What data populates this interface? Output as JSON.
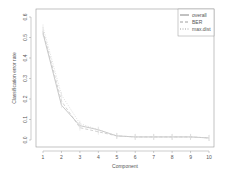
{
  "chart_data": {
    "type": "line",
    "title": "",
    "xlabel": "Component",
    "ylabel": "Classification error rate",
    "x": [
      1,
      2,
      3,
      4,
      5,
      6,
      7,
      8,
      9,
      10
    ],
    "xticks": [
      "1",
      "2",
      "3",
      "4",
      "5",
      "6",
      "7",
      "8",
      "9",
      "10"
    ],
    "yticks": [
      "0.0",
      "0.1",
      "0.2",
      "0.3",
      "0.4",
      "0.5",
      "0.6"
    ],
    "ylim": [
      0,
      0.6
    ],
    "grid": false,
    "legend_position": "top-right",
    "series": [
      {
        "name": "overall",
        "linestyle": "solid",
        "color": "#bbbbbb",
        "values": [
          0.52,
          0.17,
          0.07,
          0.05,
          0.02,
          0.015,
          0.015,
          0.015,
          0.015,
          0.01
        ]
      },
      {
        "name": "BER",
        "linestyle": "dashed",
        "color": "#c8c8c8",
        "values": [
          0.53,
          0.19,
          0.06,
          0.04,
          0.02,
          0.015,
          0.015,
          0.015,
          0.015,
          0.01
        ]
      },
      {
        "name": "max.dist",
        "linestyle": "dotted",
        "color": "#d4d4d4",
        "values": [
          0.55,
          0.22,
          0.08,
          0.05,
          0.02,
          0.015,
          0.015,
          0.015,
          0.015,
          0.01
        ]
      }
    ]
  }
}
